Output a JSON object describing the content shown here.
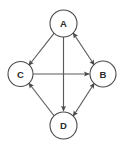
{
  "diagram": {
    "background_color": "#ffffff",
    "node_stroke_color": "#4a4a4a",
    "edge_color": "#5a5a5a",
    "label_color": "#2b2b2b",
    "nodes": [
      {
        "id": "A",
        "label": "A",
        "cx": 63.5,
        "cy": 23.5,
        "r": 13.5
      },
      {
        "id": "B",
        "label": "B",
        "cx": 103.0,
        "cy": 74.0,
        "r": 13.0
      },
      {
        "id": "C",
        "label": "C",
        "cx": 20.5,
        "cy": 74.0,
        "r": 12.5
      },
      {
        "id": "D",
        "label": "D",
        "cx": 63.5,
        "cy": 125.5,
        "r": 13.5
      }
    ],
    "edges": [
      {
        "id": "A-C",
        "from": "A",
        "to": "C",
        "direction": "one-way",
        "arrow_at": "C"
      },
      {
        "id": "A-B",
        "from": "A",
        "to": "B",
        "direction": "bidirectional",
        "arrow_at": "both"
      },
      {
        "id": "A-D",
        "from": "A",
        "to": "D",
        "direction": "one-way",
        "arrow_at": "D"
      },
      {
        "id": "C-B",
        "from": "C",
        "to": "B",
        "direction": "one-way",
        "arrow_at": "B"
      },
      {
        "id": "D-C",
        "from": "D",
        "to": "C",
        "direction": "one-way",
        "arrow_at": "C"
      },
      {
        "id": "D-B",
        "from": "D",
        "to": "B",
        "direction": "bidirectional",
        "arrow_at": "both"
      }
    ]
  }
}
